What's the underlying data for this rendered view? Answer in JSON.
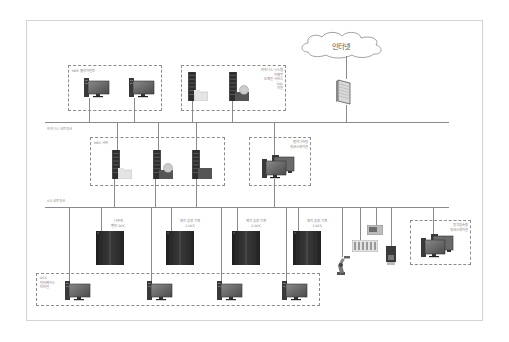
{
  "diagram": {
    "internet": {
      "label": "인터넷"
    },
    "networks": {
      "business": {
        "label": "비즈니스 네트워크"
      },
      "ics": {
        "label": "ICS 네트워크"
      }
    },
    "groups": {
      "mes_clients": {
        "label": "MES 클라이언트"
      },
      "business_systems": {
        "lines": [
          "비즈니스 시스템",
          "이메일",
          "도메인 서비스",
          "SQL",
          "지원"
        ]
      },
      "mes_servers": {
        "label": "MES 서버"
      },
      "engineering_ws": {
        "lines": [
          "엔지니어링",
          "워크스테이션"
        ]
      },
      "remote_ws": {
        "lines": [
          "원격접속용",
          "워크스테이션"
        ]
      },
      "dcs_interface": {
        "lines": [
          "DCS",
          "인터페이스",
          "터미널"
        ]
      }
    },
    "dcs_units": [
      {
        "lines": [
          "나무위",
          "밸브 DCS"
        ]
      },
      {
        "lines": [
          "제지 공정 기계",
          "1 DCS"
        ]
      },
      {
        "lines": [
          "제지 공정 기계",
          "2 DCS"
        ]
      },
      {
        "lines": [
          "제지 공정 기계",
          "3 DCS"
        ]
      }
    ],
    "field_devices": [
      "robot-arm",
      "plc-rack",
      "hmi-panel",
      "controller"
    ],
    "colors": {
      "line": "#8a8a8a",
      "dash": "#8c8c8c",
      "cabinet": "#2b2b2b",
      "monitor": "#5a5a5a",
      "frame": "#d4d4d4"
    }
  }
}
